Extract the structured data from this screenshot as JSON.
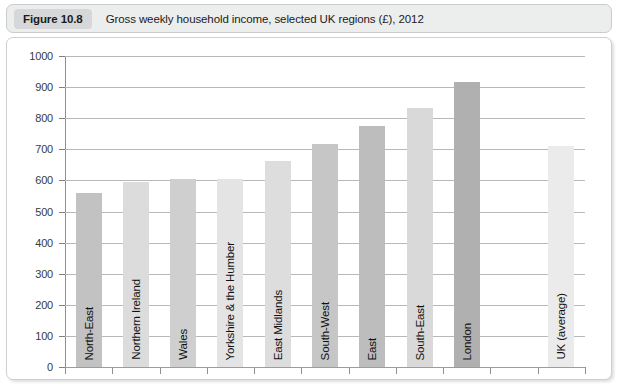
{
  "figure": {
    "number_label": "Figure 10.8",
    "caption": "Gross weekly household income, selected UK regions (£), 2012"
  },
  "chart_data": {
    "type": "bar",
    "title": "Gross weekly household income, selected UK regions (£), 2012",
    "xlabel": "",
    "ylabel": "",
    "ylim": [
      0,
      1000
    ],
    "ytick_step": 100,
    "yticks": [
      "0",
      "100",
      "200",
      "300",
      "400",
      "500",
      "600",
      "700",
      "800",
      "900",
      "1000"
    ],
    "grid": true,
    "legend": "none",
    "categories": [
      "North-East",
      "Northern Ireland",
      "Wales",
      "Yorkshire & the Humber",
      "East Midlands",
      "South-West",
      "East",
      "South-East",
      "London",
      "UK (average)"
    ],
    "values": [
      558,
      595,
      603,
      605,
      663,
      717,
      775,
      832,
      915,
      712
    ],
    "bar_colors": [
      "#c2c2c2",
      "#dcdcdc",
      "#cfcfcf",
      "#e4e4e4",
      "#dddddd",
      "#c6c6c6",
      "#bdbdbd",
      "#d9d9d9",
      "#b0b0b0",
      "#ebebeb"
    ],
    "slot_index": [
      0,
      1,
      2,
      3,
      4,
      5,
      6,
      7,
      8,
      10
    ],
    "slot_count": 11
  },
  "colors": {
    "title_bar_bg": "#eceded",
    "figure_number_bg": "#d5d7d8",
    "frame_border": "#cdcfd0",
    "gridline": "#b6b8b9",
    "axis": "#8d8f90",
    "text": "#1b1b1b",
    "page_bg": "#ffffff"
  }
}
